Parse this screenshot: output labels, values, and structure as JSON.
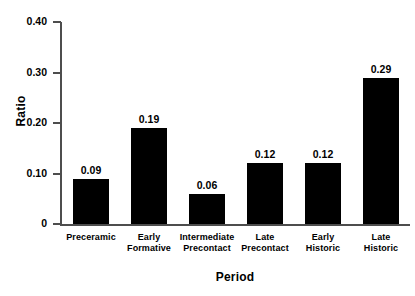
{
  "chart_data": {
    "type": "bar",
    "title": "",
    "xlabel": "Period",
    "ylabel": "Ratio",
    "categories": [
      "Preceramic",
      "Early Formative",
      "Intermediate Precontact",
      "Late Precontact",
      "Early Historic",
      "Late Historic"
    ],
    "category_lines": [
      [
        "Preceramic"
      ],
      [
        "Early",
        "Formative"
      ],
      [
        "Intermediate",
        "Precontact"
      ],
      [
        "Late",
        "Precontact"
      ],
      [
        "Early",
        "Historic"
      ],
      [
        "Late",
        "Historic"
      ]
    ],
    "values": [
      0.09,
      0.19,
      0.06,
      0.12,
      0.12,
      0.29
    ],
    "value_labels": [
      "0.09",
      "0.19",
      "0.06",
      "0.12",
      "0.12",
      "0.29"
    ],
    "ylim": [
      0,
      0.4
    ],
    "yticks": [
      0,
      0.1,
      0.2,
      0.3,
      0.4
    ],
    "ytick_labels": [
      "0",
      "0.10",
      "0.20",
      "0.30",
      "0.40"
    ],
    "grid": false,
    "legend": false,
    "bar_color": "#000000",
    "axis_color": "#4d4d4d",
    "background_color": "#ffffff"
  }
}
